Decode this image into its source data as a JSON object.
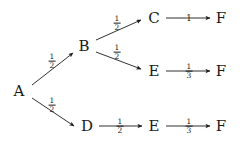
{
  "diagram": {
    "kind": "probability-tree",
    "background_color": "#ffffff",
    "ink_color": "#1a1a1a",
    "nodes": [
      {
        "id": "A",
        "label": "A",
        "x": 19,
        "y": 91
      },
      {
        "id": "B",
        "label": "B",
        "x": 84,
        "y": 46
      },
      {
        "id": "C",
        "label": "C",
        "x": 154,
        "y": 18
      },
      {
        "id": "F1",
        "label": "F",
        "x": 221,
        "y": 18
      },
      {
        "id": "E1",
        "label": "E",
        "x": 154,
        "y": 71
      },
      {
        "id": "F2",
        "label": "F",
        "x": 221,
        "y": 71
      },
      {
        "id": "D",
        "label": "D",
        "x": 87,
        "y": 126
      },
      {
        "id": "E2",
        "label": "E",
        "x": 154,
        "y": 126
      },
      {
        "id": "F3",
        "label": "F",
        "x": 221,
        "y": 126
      }
    ],
    "edges": [
      {
        "id": "A-B",
        "from": "A",
        "to": "B",
        "x1": 32,
        "y1": 85,
        "x2": 73,
        "y2": 53,
        "weight_num": "1",
        "weight_den": "2",
        "label_x": 52,
        "label_y": 61
      },
      {
        "id": "A-D",
        "from": "A",
        "to": "D",
        "x1": 32,
        "y1": 98,
        "x2": 74,
        "y2": 126,
        "weight_num": "1",
        "weight_den": "2",
        "label_x": 52,
        "label_y": 105
      },
      {
        "id": "B-C",
        "from": "B",
        "to": "C",
        "x1": 96,
        "y1": 40,
        "x2": 141,
        "y2": 20,
        "weight_num": "1",
        "weight_den": "2",
        "label_x": 117,
        "label_y": 23
      },
      {
        "id": "B-E1",
        "from": "B",
        "to": "E1",
        "x1": 96,
        "y1": 52,
        "x2": 141,
        "y2": 69,
        "weight_num": "1",
        "weight_den": "2",
        "label_x": 117,
        "label_y": 52
      },
      {
        "id": "C-F1",
        "from": "C",
        "to": "F1",
        "x1": 166,
        "y1": 18,
        "x2": 210,
        "y2": 18,
        "weight_whole": "1",
        "label_x": 189,
        "label_y": 18
      },
      {
        "id": "E1-F2",
        "from": "E1",
        "to": "F2",
        "x1": 166,
        "y1": 71,
        "x2": 210,
        "y2": 71,
        "weight_num": "1",
        "weight_den": "3",
        "label_x": 189,
        "label_y": 71
      },
      {
        "id": "D-E2",
        "from": "D",
        "to": "E2",
        "x1": 99,
        "y1": 126,
        "x2": 142,
        "y2": 126,
        "weight_num": "1",
        "weight_den": "2",
        "label_x": 120,
        "label_y": 126
      },
      {
        "id": "E2-F3",
        "from": "E2",
        "to": "F3",
        "x1": 166,
        "y1": 126,
        "x2": 210,
        "y2": 126,
        "weight_num": "1",
        "weight_den": "3",
        "label_x": 189,
        "label_y": 126
      }
    ]
  }
}
